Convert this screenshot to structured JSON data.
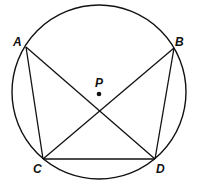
{
  "diagram": {
    "circle": {
      "cx": 99,
      "cy": 92,
      "r": 87
    },
    "center": {
      "label": "P",
      "x": 99,
      "y": 94
    },
    "points": [
      {
        "label": "A",
        "x": 26,
        "y": 47
      },
      {
        "label": "B",
        "x": 174,
        "y": 48
      },
      {
        "label": "C",
        "x": 43,
        "y": 159
      },
      {
        "label": "D",
        "x": 155,
        "y": 159
      }
    ],
    "segments": [
      [
        "A",
        "C"
      ],
      [
        "A",
        "D"
      ],
      [
        "B",
        "C"
      ],
      [
        "B",
        "D"
      ],
      [
        "C",
        "D"
      ]
    ],
    "stroke_color": "#111111"
  }
}
